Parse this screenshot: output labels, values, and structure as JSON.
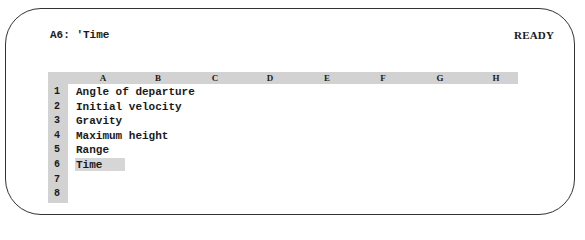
{
  "status_line": {
    "cell_ref": "A6:",
    "cell_content": "'Time",
    "mode": "READY"
  },
  "columns": [
    {
      "label": "A",
      "x": 103
    },
    {
      "label": "B",
      "x": 158
    },
    {
      "label": "C",
      "x": 215
    },
    {
      "label": "D",
      "x": 270
    },
    {
      "label": "E",
      "x": 327
    },
    {
      "label": "F",
      "x": 383
    },
    {
      "label": "G",
      "x": 440
    },
    {
      "label": "H",
      "x": 496
    }
  ],
  "rows": [
    {
      "num": "1",
      "a": "Angle of departure"
    },
    {
      "num": "2",
      "a": "Initial velocity"
    },
    {
      "num": "3",
      "a": "Gravity"
    },
    {
      "num": "4",
      "a": "Maximum height"
    },
    {
      "num": "5",
      "a": "Range"
    },
    {
      "num": "6",
      "a": "Time"
    },
    {
      "num": "7",
      "a": ""
    },
    {
      "num": "8",
      "a": ""
    }
  ],
  "selected_cell": "A6",
  "colors": {
    "header_bg": "#d2d2d2",
    "highlight_bg": "#d6d6d6",
    "border": "#333333"
  }
}
